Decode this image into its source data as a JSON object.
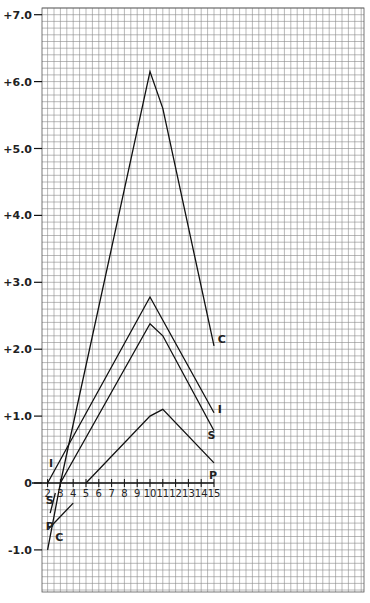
{
  "chart_data": {
    "type": "line",
    "title": "",
    "xlabel": "",
    "ylabel": "",
    "grid": true,
    "legend": "inline labels at line ends",
    "xlim": [
      1.6,
      15.3
    ],
    "ylim": [
      -1.6,
      7.0
    ],
    "x_ticks": [
      "2",
      "3",
      "4",
      "5",
      "6",
      "7",
      "8",
      "9",
      "10",
      "11",
      "12",
      "13",
      "14",
      "15"
    ],
    "y_ticks": [
      {
        "value": 7.0,
        "label": "+7.0"
      },
      {
        "value": 6.0,
        "label": "+6.0"
      },
      {
        "value": 5.0,
        "label": "+5.0"
      },
      {
        "value": 4.0,
        "label": "+4.0"
      },
      {
        "value": 3.0,
        "label": "+3.0"
      },
      {
        "value": 2.0,
        "label": "+2.0"
      },
      {
        "value": 1.0,
        "label": "+1.0"
      },
      {
        "value": 0,
        "label": "0"
      },
      {
        "value": -1.0,
        "label": "-1.0"
      }
    ],
    "series": [
      {
        "name": "C",
        "points": [
          [
            2,
            -1.0
          ],
          [
            3,
            0
          ],
          [
            10,
            6.15
          ],
          [
            11,
            5.6
          ],
          [
            15,
            2.05
          ]
        ],
        "label_pos": [
          15.3,
          2.15
        ],
        "below_label_pos": [
          2.6,
          -0.8
        ]
      },
      {
        "name": "I",
        "points": [
          [
            2,
            0
          ],
          [
            10,
            2.78
          ],
          [
            15,
            1.05
          ]
        ],
        "label_pos": [
          15.3,
          1.1
        ],
        "below_label_pos": [
          2.1,
          0.3
        ]
      },
      {
        "name": "S",
        "points": [
          [
            3,
            0
          ],
          [
            10,
            2.38
          ],
          [
            11,
            2.2
          ],
          [
            15,
            0.78
          ]
        ],
        "label_pos": [
          14.5,
          0.72
        ],
        "below_segment": [
          [
            2.2,
            -0.45
          ],
          [
            2.6,
            -0.15
          ]
        ],
        "below_label_pos": [
          1.85,
          -0.25
        ]
      },
      {
        "name": "P",
        "points": [
          [
            5,
            0
          ],
          [
            10,
            1.0
          ],
          [
            11,
            1.1
          ],
          [
            15,
            0.3
          ]
        ],
        "label_pos": [
          14.6,
          0.12
        ],
        "below_segment": [
          [
            2.1,
            -0.68
          ],
          [
            4.0,
            -0.3
          ]
        ],
        "below_label_pos": [
          1.85,
          -0.65
        ]
      }
    ]
  }
}
